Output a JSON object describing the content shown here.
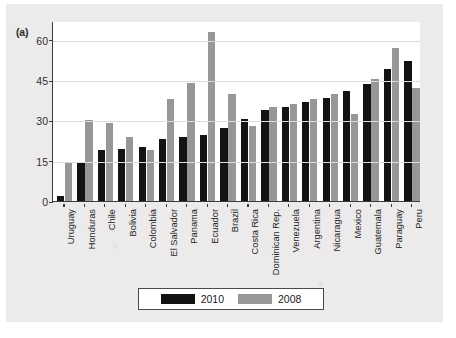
{
  "figure": {
    "panel_letter": "(a)"
  },
  "legend": {
    "entries": [
      {
        "label": "2010",
        "color": "#131313",
        "swatch_name": "legend-swatch-2010"
      },
      {
        "label": "2008",
        "color": "#979797",
        "swatch_name": "legend-swatch-2008"
      }
    ]
  },
  "chart_data": {
    "type": "bar",
    "title": "",
    "subtitle": "",
    "xlabel": "",
    "ylabel": "",
    "ylim": [
      0,
      67
    ],
    "yticks": [
      0,
      15,
      30,
      45,
      60
    ],
    "ytick_labels": [
      "0",
      "15",
      "30",
      "45",
      "60"
    ],
    "grid": true,
    "legend_position": "bottom-center",
    "categories": [
      "Uruguay",
      "Honduras",
      "Chile",
      "Bolivia",
      "Colombia",
      "El Salvador",
      "Panama",
      "Ecuador",
      "Brazil",
      "Costa Rica",
      "Dominican Rep.",
      "Venezuela",
      "Argentina",
      "Nicaragua",
      "Mexico",
      "Guatemala",
      "Paraguay",
      "Peru"
    ],
    "series": [
      {
        "name": "2010",
        "color": "#131313",
        "values": [
          2,
          14,
          19,
          19.5,
          20,
          23,
          24,
          24.5,
          27,
          30.5,
          34,
          35,
          37,
          38.5,
          41,
          43.5,
          49,
          52
        ]
      },
      {
        "name": "2008",
        "color": "#979797",
        "values": [
          14,
          30,
          29,
          24,
          19,
          38,
          44,
          63,
          40,
          28,
          35,
          36,
          38,
          40,
          32.5,
          45.5,
          57,
          42
        ]
      }
    ]
  }
}
